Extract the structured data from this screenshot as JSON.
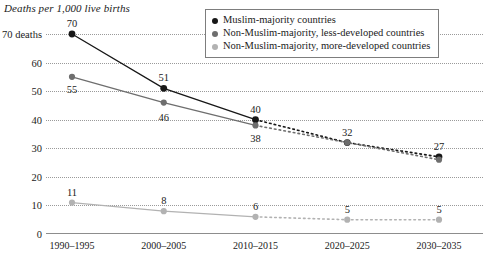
{
  "chart_data": {
    "type": "line",
    "title": "Deaths per 1,000 live births",
    "xlabel": "",
    "ylabel": "Deaths per 1,000 live births",
    "categories": [
      "1990–1995",
      "2000–2005",
      "2010–2015",
      "2020–2025",
      "2030–2035"
    ],
    "ylim": [
      0,
      70
    ],
    "yticks": [
      0,
      10,
      20,
      30,
      40,
      50,
      60,
      70
    ],
    "ytick_labels": [
      "0",
      "10",
      "20",
      "30",
      "40",
      "50",
      "60",
      "70 deaths"
    ],
    "grid": true,
    "legend_position": "top-right",
    "projection_starts_after_index": 2,
    "series": [
      {
        "name": "Muslim-majority countries",
        "color": "#171717",
        "values": [
          70,
          51,
          40,
          32,
          27
        ],
        "labels": [
          "70",
          "51",
          "40",
          "32",
          "27"
        ]
      },
      {
        "name": "Non-Muslim-majority, less-developed countries",
        "color": "#6e6e6e",
        "values": [
          55,
          46,
          38,
          32,
          26
        ],
        "labels": [
          "55",
          "46",
          "38",
          "",
          ""
        ]
      },
      {
        "name": "Non-Muslim-majority, more-developed countries",
        "color": "#b2b2b2",
        "values": [
          11,
          8,
          6,
          5,
          5
        ],
        "labels": [
          "11",
          "8",
          "6",
          "5",
          "5"
        ]
      }
    ]
  },
  "legend": {
    "items": [
      {
        "label": "Muslim-majority countries",
        "color": "#171717"
      },
      {
        "label": "Non-Muslim-majority, less-developed countries",
        "color": "#6e6e6e"
      },
      {
        "label": "Non-Muslim-majority, more-developed countries",
        "color": "#b2b2b2"
      }
    ]
  }
}
